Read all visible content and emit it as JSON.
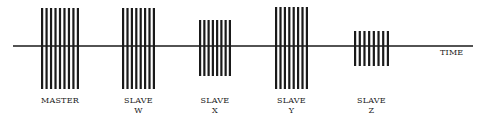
{
  "diagram": {
    "axis": {
      "label": "TIME",
      "y": 46,
      "x_start": 13,
      "x_end": 473,
      "label_x": 440,
      "label_y": 55
    },
    "colors": {
      "ink": "#1a1a1a",
      "background": "#ffffff"
    },
    "groups": [
      {
        "id": "master",
        "line1": "MASTER",
        "line2": "",
        "x_start": 41,
        "x_end": 79,
        "y_top": 8,
        "y_bottom": 89,
        "pulses": 9
      },
      {
        "id": "slave-w",
        "line1": "SLAVE",
        "line2": "W",
        "x_start": 122,
        "x_end": 155,
        "y_top": 8,
        "y_bottom": 89,
        "pulses": 8
      },
      {
        "id": "slave-x",
        "line1": "SLAVE",
        "line2": "X",
        "x_start": 199,
        "x_end": 231,
        "y_top": 20,
        "y_bottom": 76,
        "pulses": 8
      },
      {
        "id": "slave-y",
        "line1": "SLAVE",
        "line2": "Y",
        "x_start": 275,
        "x_end": 308,
        "y_top": 7,
        "y_bottom": 89,
        "pulses": 8
      },
      {
        "id": "slave-z",
        "line1": "SLAVE",
        "line2": "Z",
        "x_start": 354,
        "x_end": 389,
        "y_top": 31,
        "y_bottom": 66,
        "pulses": 8
      }
    ]
  }
}
